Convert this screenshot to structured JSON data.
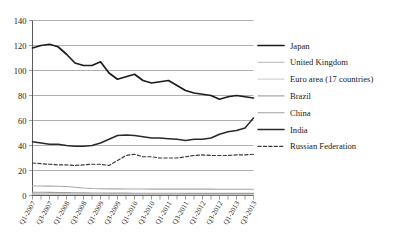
{
  "chart_data": {
    "type": "line",
    "title": "",
    "xlabel": "",
    "ylabel": "",
    "ylim": [
      0,
      140
    ],
    "ytick_step": 20,
    "yticks": [
      "0",
      "20",
      "40",
      "60",
      "80",
      "100",
      "120",
      "140"
    ],
    "grid": true,
    "legend_position": "right",
    "x": [
      "Q1-2007",
      "Q2-2007",
      "Q3-2007",
      "Q4-2007",
      "Q1-2008",
      "Q2-2008",
      "Q3-2008",
      "Q4-2008",
      "Q1-2009",
      "Q2-2009",
      "Q3-2009",
      "Q4-2009",
      "Q1-2010",
      "Q2-2010",
      "Q3-2010",
      "Q4-2010",
      "Q1-2011",
      "Q2-2011",
      "Q3-2011",
      "Q4-2011",
      "Q1-2012",
      "Q2-2012",
      "Q3-2012",
      "Q4-2012",
      "Q1-2013",
      "Q2-2013",
      "Q3-2013"
    ],
    "xtick_labels": [
      "Q1-2007",
      "Q3-2007",
      "Q1-2008",
      "Q3-2008",
      "Q1-2009",
      "Q3-2009",
      "Q1-2010",
      "Q3-2010",
      "Q1-2011",
      "Q3-2011",
      "Q1-2012",
      "Q3-2012",
      "Q1-2013",
      "Q3-2013"
    ],
    "series": [
      {
        "name": "Japan",
        "color": "#1c1c1c",
        "width": 1.7,
        "dash": "",
        "values": [
          118,
          120,
          121,
          119,
          113,
          106,
          104,
          104,
          107,
          98,
          93,
          95,
          97,
          92,
          90,
          91,
          92,
          88,
          84,
          82,
          81,
          80,
          77,
          79,
          80,
          79,
          78
        ]
      },
      {
        "name": "United Kingdom",
        "color": "#b4b4b4",
        "width": 1.0,
        "dash": "",
        "values": [
          1.4,
          1.4,
          1.4,
          1.4,
          1.3,
          1.3,
          1.2,
          1.2,
          1.2,
          1.1,
          1.1,
          1.1,
          1.1,
          1.0,
          1.0,
          1.0,
          1.0,
          1.0,
          1.0,
          1.0,
          1.0,
          1.0,
          1.0,
          1.0,
          1.0,
          1.0,
          1.0
        ]
      },
      {
        "name": "Euro area (17 countries)",
        "color": "#c8c8c8",
        "width": 1.0,
        "dash": "",
        "values": [
          0.9,
          0.9,
          0.9,
          0.9,
          0.8,
          0.8,
          0.8,
          0.8,
          0.8,
          0.7,
          0.7,
          0.7,
          0.7,
          0.7,
          0.7,
          0.7,
          0.7,
          0.7,
          0.6,
          0.6,
          0.6,
          0.6,
          0.6,
          0.6,
          0.6,
          0.6,
          0.6
        ]
      },
      {
        "name": "Brazil",
        "color": "#a8a8a8",
        "width": 1.1,
        "dash": "",
        "values": [
          7.6,
          7.6,
          7.5,
          7.4,
          7.2,
          6.6,
          6.0,
          5.6,
          5.4,
          5.3,
          5.3,
          5.2,
          5.2,
          5.2,
          5.1,
          5.1,
          5.1,
          5.1,
          5.1,
          5.1,
          5.1,
          5.1,
          5.0,
          5.0,
          5.0,
          5.0,
          5.0
        ]
      },
      {
        "name": "China",
        "color": "#9e9e9e",
        "width": 1.1,
        "dash": "",
        "values": [
          2.6,
          2.6,
          2.5,
          2.4,
          2.3,
          2.2,
          2.1,
          2.0,
          2.0,
          1.9,
          1.9,
          1.9,
          1.8,
          1.8,
          1.8,
          1.8,
          1.8,
          1.8,
          1.7,
          1.7,
          1.7,
          1.7,
          1.7,
          1.7,
          1.7,
          1.7,
          1.7
        ]
      },
      {
        "name": "India",
        "color": "#2a2a2a",
        "width": 1.5,
        "dash": "",
        "values": [
          43,
          42,
          41,
          41,
          40,
          39.5,
          39.5,
          40,
          42,
          45,
          48,
          48.5,
          48,
          47,
          46,
          46,
          45.5,
          45,
          44,
          45,
          45,
          46,
          49,
          51,
          52,
          54,
          62
        ]
      },
      {
        "name": "Russian Federation",
        "color": "#3a3a3a",
        "width": 1.2,
        "dash": "3.2,2.2",
        "values": [
          26,
          25.5,
          25,
          24.5,
          24.5,
          24,
          24.5,
          25,
          25,
          24,
          28,
          32,
          33,
          31,
          31,
          30,
          30,
          30,
          31,
          32,
          32.5,
          32,
          32,
          32,
          32.5,
          32.5,
          33
        ]
      }
    ]
  }
}
